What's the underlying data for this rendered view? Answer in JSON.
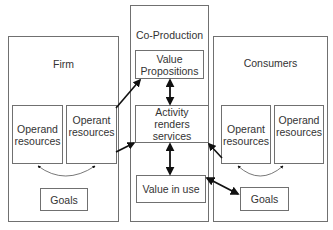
{
  "diagram": {
    "groups": {
      "firm": {
        "title": "Firm"
      },
      "coproduction": {
        "title": "Co-Production"
      },
      "consumers": {
        "title": "Consumers"
      }
    },
    "firm_nodes": {
      "operand": "Operand resources",
      "operant": "Operant resources",
      "goals": "Goals"
    },
    "coproduction_nodes": {
      "value_propositions": "Value Propositions",
      "activity": "Activity renders services",
      "value_in_use": "Value in use"
    },
    "consumer_nodes": {
      "operant": "Operant resources",
      "operand": "Operand resources",
      "goals": "Goals"
    },
    "edges": [
      {
        "from": "Firm Operant resources",
        "to": "Value Propositions",
        "type": "directed"
      },
      {
        "from": "Firm Operant resources",
        "to": "Activity renders services",
        "type": "directed"
      },
      {
        "from": "Value Propositions",
        "to": "Activity renders services",
        "type": "bidirectional"
      },
      {
        "from": "Activity renders services",
        "to": "Value in use",
        "type": "bidirectional"
      },
      {
        "from": "Consumer Operant resources",
        "to": "Activity renders services",
        "type": "directed"
      },
      {
        "from": "Value in use",
        "to": "Consumer Goals",
        "type": "bidirectional"
      },
      {
        "from": "Firm Operand resources",
        "to": "Firm Operant resources",
        "type": "curved-bidirectional"
      },
      {
        "from": "Consumer Operant resources",
        "to": "Consumer Operand resources",
        "type": "curved-bidirectional"
      }
    ],
    "colors": {
      "border": "#707070",
      "arrow": "#111111",
      "text": "#333333"
    }
  }
}
